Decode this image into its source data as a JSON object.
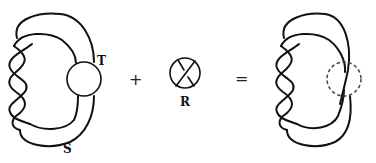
{
  "diagram": {
    "left_figure": {
      "tangle_label": "T",
      "strand_label": "S"
    },
    "operator_plus": "+",
    "middle_figure": {
      "tangle_label": "R"
    },
    "operator_equals": "=",
    "right_figure": {
      "description": "result with dashed tangle region"
    },
    "colors": {
      "stroke": "#111111",
      "background": "#ffffff"
    }
  }
}
